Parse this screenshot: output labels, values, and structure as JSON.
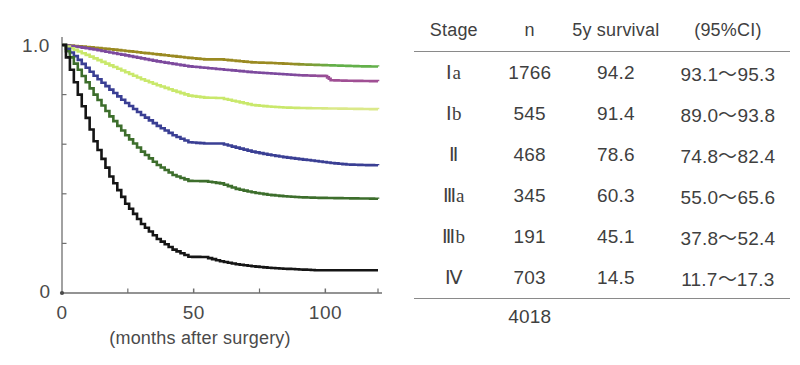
{
  "chart_data": {
    "type": "line",
    "title": "",
    "xlabel": "(months after surgery)",
    "ylabel": "",
    "xlim": [
      0,
      120
    ],
    "ylim": [
      0,
      1.0
    ],
    "grid": false,
    "legend": "none",
    "x_ticks": [
      {
        "value": 0,
        "label": "0",
        "major": true
      },
      {
        "value": 25,
        "label": "",
        "major": false
      },
      {
        "value": 50,
        "label": "50",
        "major": true
      },
      {
        "value": 75,
        "label": "",
        "major": false
      },
      {
        "value": 100,
        "label": "100",
        "major": true
      },
      {
        "value": 120,
        "label": "",
        "major": false
      }
    ],
    "y_ticks": [
      {
        "value": 0.0,
        "label": "0",
        "major": true
      },
      {
        "value": 0.2,
        "label": "",
        "major": false
      },
      {
        "value": 0.4,
        "label": "",
        "major": false
      },
      {
        "value": 0.6,
        "label": "",
        "major": false
      },
      {
        "value": 0.8,
        "label": "",
        "major": false
      },
      {
        "value": 1.0,
        "label": "1.0",
        "major": true
      }
    ],
    "series": [
      {
        "name": "I a",
        "color": "#9a8a22",
        "end_color": "#63b04a",
        "x": [
          0,
          6,
          12,
          18,
          24,
          30,
          36,
          42,
          48,
          54,
          60,
          66,
          72,
          78,
          84,
          90,
          96,
          102,
          108,
          114,
          120
        ],
        "y": [
          1.0,
          0.995,
          0.989,
          0.983,
          0.976,
          0.969,
          0.962,
          0.955,
          0.948,
          0.942,
          0.942,
          0.936,
          0.93,
          0.928,
          0.925,
          0.922,
          0.92,
          0.918,
          0.916,
          0.914,
          0.913
        ]
      },
      {
        "name": "I b",
        "color": "#7d4a9e",
        "end_color": "#a04f94",
        "x": [
          0,
          6,
          12,
          18,
          24,
          30,
          36,
          42,
          48,
          54,
          60,
          66,
          72,
          78,
          84,
          90,
          96,
          100,
          102,
          108,
          114,
          120
        ],
        "y": [
          1.0,
          0.992,
          0.982,
          0.97,
          0.958,
          0.946,
          0.934,
          0.924,
          0.914,
          0.908,
          0.902,
          0.896,
          0.89,
          0.886,
          0.882,
          0.878,
          0.876,
          0.875,
          0.858,
          0.856,
          0.855,
          0.854
        ]
      },
      {
        "name": "II",
        "color": "#c9e86b",
        "end_color": "#dbe98a",
        "x": [
          0,
          6,
          12,
          18,
          24,
          30,
          36,
          42,
          48,
          54,
          60,
          66,
          72,
          78,
          84,
          90,
          96,
          102,
          108,
          114,
          120
        ],
        "y": [
          1.0,
          0.974,
          0.946,
          0.918,
          0.89,
          0.862,
          0.838,
          0.816,
          0.796,
          0.788,
          0.786,
          0.772,
          0.758,
          0.752,
          0.748,
          0.746,
          0.745,
          0.744,
          0.743,
          0.742,
          0.741
        ]
      },
      {
        "name": "III a",
        "color": "#3a3f94",
        "end_color": "#3a3f94",
        "x": [
          0,
          6,
          12,
          18,
          24,
          30,
          36,
          42,
          48,
          54,
          60,
          66,
          72,
          78,
          84,
          90,
          96,
          102,
          108,
          114,
          120
        ],
        "y": [
          1.0,
          0.94,
          0.876,
          0.82,
          0.766,
          0.718,
          0.674,
          0.636,
          0.608,
          0.603,
          0.603,
          0.586,
          0.57,
          0.558,
          0.548,
          0.54,
          0.532,
          0.524,
          0.518,
          0.516,
          0.515
        ]
      },
      {
        "name": "III b",
        "color": "#3d6e2c",
        "end_color": "#3d6e2c",
        "x": [
          0,
          6,
          12,
          18,
          24,
          30,
          36,
          42,
          48,
          54,
          60,
          66,
          72,
          78,
          84,
          90,
          96,
          102,
          108,
          114,
          120
        ],
        "y": [
          1.0,
          0.9,
          0.8,
          0.712,
          0.636,
          0.57,
          0.516,
          0.476,
          0.452,
          0.451,
          0.442,
          0.42,
          0.406,
          0.396,
          0.39,
          0.386,
          0.384,
          0.383,
          0.382,
          0.381,
          0.38
        ]
      },
      {
        "name": "IV",
        "color": "#151515",
        "end_color": "#151515",
        "x": [
          0,
          6,
          12,
          18,
          24,
          30,
          36,
          42,
          48,
          54,
          60,
          66,
          72,
          78,
          84,
          90,
          96,
          102,
          108,
          114,
          120
        ],
        "y": [
          1.0,
          0.8,
          0.612,
          0.47,
          0.36,
          0.278,
          0.218,
          0.175,
          0.146,
          0.145,
          0.128,
          0.116,
          0.108,
          0.102,
          0.098,
          0.095,
          0.092,
          0.092,
          0.092,
          0.092,
          0.092
        ]
      }
    ]
  },
  "table": {
    "headers": {
      "stage": "Stage",
      "n": "n",
      "survival": "5y survival",
      "ci": "(95%CI)"
    },
    "rows": [
      {
        "stage": "Ⅰa",
        "n": "1766",
        "survival": "94.2",
        "ci": "93.1～95.3"
      },
      {
        "stage": "Ⅰb",
        "n": "545",
        "survival": "91.4",
        "ci": "89.0～93.8"
      },
      {
        "stage": "Ⅱ",
        "n": "468",
        "survival": "78.6",
        "ci": "74.8～82.4"
      },
      {
        "stage": "Ⅲa",
        "n": "345",
        "survival": "60.3",
        "ci": "55.0～65.6"
      },
      {
        "stage": "Ⅲb",
        "n": "191",
        "survival": "45.1",
        "ci": "37.8～52.4"
      },
      {
        "stage": "Ⅳ",
        "n": "703",
        "survival": "14.5",
        "ci": "11.7～17.3"
      }
    ],
    "total": {
      "n": "4018"
    }
  },
  "axis_text": {
    "y_top": "1.0",
    "y_bottom": "0",
    "x_zero": "0",
    "x_fifty": "50",
    "x_hundred": "100",
    "x_title": "(months after surgery)"
  }
}
